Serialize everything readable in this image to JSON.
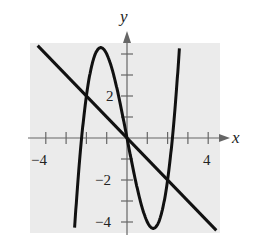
{
  "chart_data": {
    "type": "line",
    "title": "",
    "xlabel": "x",
    "ylabel": "y",
    "xlim": [
      -4.5,
      4.5
    ],
    "ylim": [
      -4.5,
      4.5
    ],
    "x_tick_labels": [
      "-4",
      "4"
    ],
    "y_tick_labels": [
      "2",
      "-2",
      "-4"
    ],
    "grid": false,
    "background": "#ececec",
    "series": [
      {
        "name": "f(x) = x^3 - 5x",
        "type": "curve",
        "points": [
          [
            -2.24,
            0
          ],
          [
            -1.29,
            4.3
          ],
          [
            0,
            0
          ],
          [
            1.29,
            -4.3
          ],
          [
            2.24,
            0
          ]
        ]
      },
      {
        "name": "y = -x",
        "type": "line",
        "points": [
          [
            -4.5,
            4.5
          ],
          [
            4.5,
            -4.5
          ]
        ]
      }
    ],
    "intersections": [
      [
        -2,
        2
      ],
      [
        0,
        0
      ],
      [
        2,
        -2
      ]
    ]
  },
  "labels": {
    "x_axis": "x",
    "y_axis": "y",
    "xm4": "−4",
    "x4": "4",
    "y2": "2",
    "ym2": "−2",
    "ym4": "−4"
  }
}
